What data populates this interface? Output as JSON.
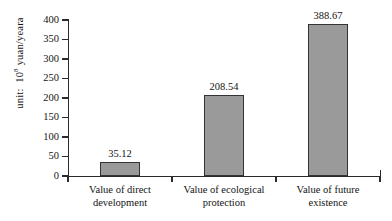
{
  "chart_data": {
    "type": "bar",
    "title": "",
    "subtitle": "",
    "xlabel": "",
    "ylabel": "unit: 10^8 yuan/yeara",
    "ylabel_prefix": "unit:",
    "ylabel_base": "10",
    "ylabel_exponent": "8",
    "ylabel_suffix": "yuan/yeara",
    "categories": [
      "Value of direct development",
      "Value of ecological protection",
      "Value of future existence"
    ],
    "category_lines": [
      [
        "Value of direct",
        "development"
      ],
      [
        "Value of ecological",
        "protection"
      ],
      [
        "Value of future",
        "existence"
      ]
    ],
    "values": [
      35.12,
      208.54,
      388.67
    ],
    "value_labels": [
      "35.12",
      "208.54",
      "388.67"
    ],
    "ylim": [
      0,
      400
    ],
    "ytick_values": [
      400,
      350,
      300,
      250,
      200,
      150,
      100,
      50,
      0
    ],
    "ytick_labels": [
      "400",
      "350",
      "300",
      "250",
      "200",
      "150",
      "100",
      "50",
      "0"
    ],
    "grid": false,
    "legend": null,
    "legend_position": "none",
    "bar_color": "#9a9a9a",
    "bar_border_color": "#333333",
    "axis_color": "#2b2b2b",
    "background_color": "#ffffff",
    "text_color": "#141414"
  }
}
